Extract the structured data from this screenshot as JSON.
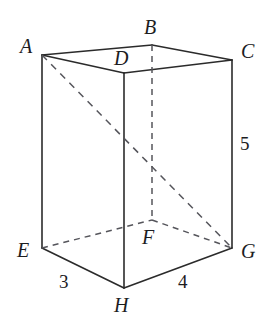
{
  "figure": {
    "type": "rectangular-prism-diagram",
    "background_color": "#ffffff",
    "solid_edge_color": "#2b2b2b",
    "hidden_edge_color": "#55555b",
    "label_color": "#1d1d1f"
  },
  "vertices": [
    {
      "key": "A",
      "label": "A",
      "x": 42,
      "y": 55,
      "label_x": 20,
      "label_y": 36,
      "hidden": false
    },
    {
      "key": "B",
      "label": "B",
      "x": 152,
      "y": 45,
      "label_x": 144,
      "label_y": 17,
      "hidden": true
    },
    {
      "key": "C",
      "label": "C",
      "x": 232,
      "y": 60,
      "label_x": 241,
      "label_y": 41,
      "hidden": false
    },
    {
      "key": "D",
      "label": "D",
      "x": 124,
      "y": 73,
      "label_x": 114,
      "label_y": 48,
      "hidden": false
    },
    {
      "key": "E",
      "label": "E",
      "x": 42,
      "y": 248,
      "label_x": 17,
      "label_y": 240,
      "hidden": false
    },
    {
      "key": "F",
      "label": "F",
      "x": 152,
      "y": 220,
      "label_x": 142,
      "label_y": 227,
      "hidden": true
    },
    {
      "key": "G",
      "label": "G",
      "x": 232,
      "y": 248,
      "label_x": 241,
      "label_y": 241,
      "hidden": false
    },
    {
      "key": "H",
      "label": "H",
      "x": 124,
      "y": 288,
      "label_x": 114,
      "label_y": 295,
      "hidden": false
    }
  ],
  "edges": [
    {
      "from": "A",
      "to": "B",
      "style": "solid",
      "name": "edge-ab"
    },
    {
      "from": "B",
      "to": "C",
      "style": "solid",
      "name": "edge-bc"
    },
    {
      "from": "A",
      "to": "D",
      "style": "solid",
      "name": "edge-ad"
    },
    {
      "from": "D",
      "to": "C",
      "style": "solid",
      "name": "edge-dc"
    },
    {
      "from": "A",
      "to": "E",
      "style": "solid",
      "name": "edge-ae"
    },
    {
      "from": "C",
      "to": "G",
      "style": "solid",
      "name": "edge-cg"
    },
    {
      "from": "D",
      "to": "H",
      "style": "solid",
      "name": "edge-dh"
    },
    {
      "from": "E",
      "to": "H",
      "style": "solid",
      "name": "edge-eh"
    },
    {
      "from": "H",
      "to": "G",
      "style": "solid",
      "name": "edge-hg"
    },
    {
      "from": "B",
      "to": "F",
      "style": "hidden",
      "name": "edge-bf"
    },
    {
      "from": "E",
      "to": "F",
      "style": "hidden",
      "name": "edge-ef"
    },
    {
      "from": "F",
      "to": "G",
      "style": "hidden",
      "name": "edge-fg"
    }
  ],
  "diagonals": [
    {
      "from": "A",
      "to": "G",
      "style": "hidden",
      "name": "diagonal-ag"
    }
  ],
  "measurements": [
    {
      "key": "eh",
      "value": "3",
      "edge": "E-H",
      "x": 59,
      "y": 272,
      "name": "edge-length-eh"
    },
    {
      "key": "hg",
      "value": "4",
      "edge": "H-G",
      "x": 178,
      "y": 272,
      "name": "edge-length-hg"
    },
    {
      "key": "cg",
      "value": "5",
      "edge": "C-G",
      "x": 240,
      "y": 134,
      "name": "edge-length-cg"
    }
  ],
  "chart_data": {
    "type": "diagram",
    "dimensions": {
      "width": 3,
      "depth": 4,
      "height": 5
    },
    "labeled_edges": [
      {
        "edge": "EH",
        "length": 3
      },
      {
        "edge": "HG",
        "length": 4
      },
      {
        "edge": "CG",
        "length": 5
      }
    ],
    "vertex_labels": [
      "A",
      "B",
      "C",
      "D",
      "E",
      "F",
      "G",
      "H"
    ],
    "hidden_vertices": [
      "B",
      "F"
    ],
    "drawn_diagonal": "AG"
  }
}
